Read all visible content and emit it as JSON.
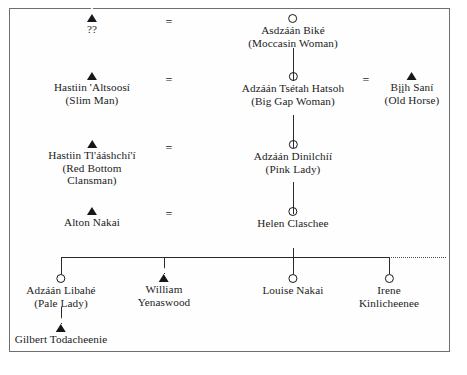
{
  "figure": {
    "kind": "kinship-genealogy-chart",
    "frame": {
      "border_color": "#6f6f70",
      "background": "#fefefe"
    },
    "line_color": "#2a2a2c",
    "symbol_legend": {
      "triangle": "male",
      "circle": "female",
      "equals": "marriage",
      "dotted_line": "continues"
    }
  },
  "generations": [
    {
      "index": 1,
      "persons": [
        {
          "id": "g1-husband",
          "symbol": "triangle",
          "sex": "male",
          "name": "??",
          "gloss": "",
          "lines": [
            "??"
          ]
        },
        {
          "id": "g1-wife",
          "symbol": "circle",
          "sex": "female",
          "name": "Asdzáán Biké",
          "gloss": "(Moccasin Woman)",
          "lines": [
            "Asdzáán Biké",
            "(Moccasin Woman)"
          ]
        }
      ],
      "marriage_symbol": "="
    },
    {
      "index": 2,
      "persons": [
        {
          "id": "g2-husband",
          "symbol": "triangle",
          "sex": "male",
          "name": "Hastiin 'Altsoosí",
          "gloss": "(Slim Man)",
          "lines": [
            "Hastiin 'Altsoosí",
            "(Slim Man)"
          ]
        },
        {
          "id": "g2-wife",
          "symbol": "circle",
          "sex": "female",
          "name": "Adzáán Tsétah Hatsoh",
          "gloss": "(Big Gap Woman)",
          "lines": [
            "Adzáán Tsétah Hatsoh",
            "(Big Gap Woman)"
          ]
        },
        {
          "id": "g2-husband2",
          "symbol": "triangle",
          "sex": "male",
          "name": "Bįįh Saní",
          "gloss": "(Old Horse)",
          "lines": [
            "Bįįh Saní",
            "(Old Horse)"
          ]
        }
      ],
      "marriage_symbol": "=",
      "marriage_symbol_2": "="
    },
    {
      "index": 3,
      "persons": [
        {
          "id": "g3-husband",
          "symbol": "triangle",
          "sex": "male",
          "name": "Hastiin Tl'ááshchí'í",
          "gloss": "(Red Bottom Clansman)",
          "lines": [
            "Hastiin Tl'ááshchí'í",
            "(Red Bottom",
            "Clansman)"
          ]
        },
        {
          "id": "g3-wife",
          "symbol": "circle",
          "sex": "female",
          "name": "Adzáán Dinilchíí",
          "gloss": "(Pink Lady)",
          "lines": [
            "Adzáán Dinilchíí",
            "(Pink Lady)"
          ]
        }
      ],
      "marriage_symbol": "="
    },
    {
      "index": 4,
      "persons": [
        {
          "id": "g4-husband",
          "symbol": "triangle",
          "sex": "male",
          "name": "Alton Nakai",
          "gloss": "",
          "lines": [
            "Alton Nakai"
          ]
        },
        {
          "id": "g4-wife",
          "symbol": "circle",
          "sex": "female",
          "name": "Helen Claschee",
          "gloss": "",
          "lines": [
            "Helen Claschee"
          ]
        }
      ],
      "marriage_symbol": "="
    },
    {
      "index": 5,
      "persons": [
        {
          "id": "g5-child1",
          "symbol": "circle",
          "sex": "female",
          "name": "Adzáán Libahé",
          "gloss": "(Pale Lady)",
          "lines": [
            "Adzáán Libahé",
            "(Pale Lady)"
          ]
        },
        {
          "id": "g5-child2",
          "symbol": "triangle",
          "sex": "male",
          "name": "William Yenaswood",
          "gloss": "",
          "lines": [
            "William",
            "Yenaswood"
          ]
        },
        {
          "id": "g5-child3",
          "symbol": "circle",
          "sex": "female",
          "name": "Louise Nakai",
          "gloss": "",
          "lines": [
            "Louise Nakai"
          ]
        },
        {
          "id": "g5-child4",
          "symbol": "circle",
          "sex": "female",
          "name": "Irene Kinlicheenee",
          "gloss": "",
          "lines": [
            "Irene",
            "Kinlicheenee"
          ]
        }
      ]
    },
    {
      "index": 6,
      "persons": [
        {
          "id": "g6-child1",
          "symbol": "triangle",
          "sex": "male",
          "name": "Gilbert Todacheenie",
          "gloss": "",
          "lines": [
            "Gilbert Todacheenie"
          ]
        }
      ]
    }
  ]
}
